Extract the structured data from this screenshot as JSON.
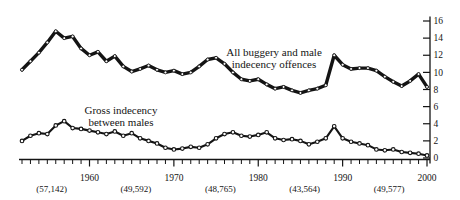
{
  "page": {
    "background": "#ffffff",
    "ink_color": "#141414"
  },
  "chart_data": {
    "type": "line",
    "title": "",
    "xlabel": "",
    "ylabel": "",
    "x_range": [
      1952,
      2000
    ],
    "ylim": [
      0,
      16
    ],
    "y_ticks": [
      0,
      2,
      4,
      6,
      8,
      10,
      12,
      14,
      16
    ],
    "y_axis_side": "right",
    "grid": "off",
    "legend": "inline-annotations",
    "x_decade_labels": [
      "1960",
      "1970",
      "1980",
      "1990",
      "2000"
    ],
    "x_decade_years": [
      1960,
      1970,
      1980,
      1990,
      2000
    ],
    "x_sub_labels": [
      {
        "year": 1955,
        "label": "(57,142)"
      },
      {
        "year": 1965,
        "label": "(49,592)"
      },
      {
        "year": 1975,
        "label": "(48,765)"
      },
      {
        "year": 1985,
        "label": "(43,564)"
      },
      {
        "year": 1995,
        "label": "(49,577)"
      }
    ],
    "line_color": "#141414",
    "marker_fill": "#ffffff",
    "series": [
      {
        "name": "All buggery and male indecency offences",
        "label_lines": [
          "All buggery and male",
          "indecency offences"
        ],
        "x_start": 1952,
        "step": 1,
        "values": [
          10.3,
          11.3,
          12.3,
          13.5,
          14.8,
          14.0,
          14.2,
          12.8,
          12.0,
          12.4,
          11.3,
          11.9,
          10.7,
          10.1,
          10.4,
          10.8,
          10.3,
          10.0,
          10.2,
          9.8,
          10.0,
          10.7,
          11.5,
          11.7,
          11.0,
          10.0,
          9.2,
          9.0,
          9.2,
          8.6,
          8.1,
          8.3,
          7.9,
          7.6,
          7.9,
          8.1,
          8.5,
          12.0,
          10.9,
          10.4,
          10.5,
          10.5,
          10.2,
          9.5,
          8.9,
          8.4,
          9.0,
          9.8,
          8.3
        ]
      },
      {
        "name": "Gross indecency between males",
        "label_lines": [
          "Gross indecency",
          "between males"
        ],
        "x_start": 1952,
        "step": 1,
        "values": [
          2.0,
          2.6,
          2.9,
          2.8,
          3.8,
          4.3,
          3.5,
          3.4,
          3.2,
          3.0,
          2.8,
          3.1,
          2.6,
          2.9,
          2.3,
          2.0,
          1.7,
          1.2,
          1.0,
          1.1,
          1.3,
          1.2,
          1.6,
          2.3,
          2.8,
          3.0,
          2.6,
          2.5,
          2.7,
          3.0,
          2.3,
          2.1,
          2.2,
          2.0,
          1.6,
          1.9,
          2.3,
          3.7,
          2.3,
          1.9,
          1.7,
          1.5,
          1.0,
          0.9,
          1.0,
          0.7,
          0.6,
          0.5,
          0.3
        ]
      }
    ]
  }
}
